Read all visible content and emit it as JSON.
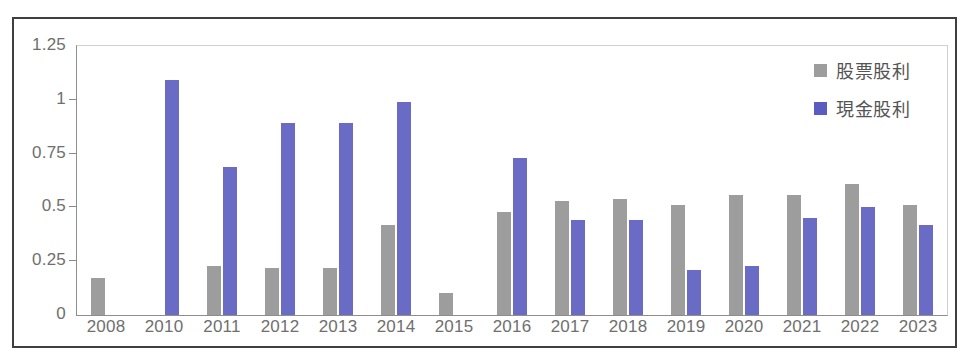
{
  "chart_data": {
    "type": "bar",
    "title": "",
    "xlabel": "",
    "ylabel": "",
    "ylim": [
      0,
      1.25
    ],
    "yticks": [
      "0",
      "0.25",
      "0.5",
      "0.75",
      "1",
      "1.25"
    ],
    "ytick_values": [
      0,
      0.25,
      0.5,
      0.75,
      1,
      1.25
    ],
    "grid": false,
    "legend_position": "top-right",
    "categories": [
      "2008",
      "2010",
      "2011",
      "2012",
      "2013",
      "2014",
      "2015",
      "2016",
      "2017",
      "2018",
      "2019",
      "2020",
      "2021",
      "2022",
      "2023"
    ],
    "series": [
      {
        "name": "股票股利",
        "color": "#9d9d9d",
        "values": [
          0.17,
          0,
          0.23,
          0.22,
          0.22,
          0.42,
          0.1,
          0.48,
          0.53,
          0.54,
          0.51,
          0.56,
          0.56,
          0.61,
          0.51
        ]
      },
      {
        "name": "現金股利",
        "color": "#6a6bc4",
        "values": [
          0,
          1.09,
          0.69,
          0.89,
          0.89,
          0.99,
          0,
          0.73,
          0.44,
          0.44,
          0.21,
          0.23,
          0.45,
          0.5,
          0.42
        ]
      }
    ]
  },
  "legend": {
    "items": [
      {
        "label": "股票股利",
        "swatch": "stock"
      },
      {
        "label": "現金股利",
        "swatch": "cash"
      }
    ]
  },
  "colors": {
    "stock_dividend": "#9d9d9d",
    "cash_dividend": "#6a6bc4",
    "axis": "#8e8e8e",
    "tick_text": "#6f6f6f",
    "frame": "#3f3f3f"
  }
}
